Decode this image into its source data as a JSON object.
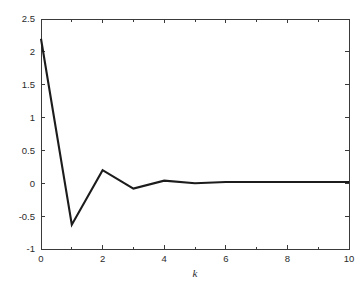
{
  "chart_data": {
    "type": "line",
    "title": "",
    "subtitle": "",
    "xlabel": "k",
    "ylabel": "",
    "xlim": [
      0,
      10
    ],
    "ylim": [
      -1,
      2.5
    ],
    "grid": false,
    "legend": null,
    "x": [
      0,
      1,
      2,
      3,
      4,
      5,
      6,
      7,
      8,
      9,
      10
    ],
    "values": [
      2.2,
      -0.63,
      0.2,
      -0.08,
      0.04,
      0.0,
      0.02,
      0.02,
      0.02,
      0.02,
      0.02
    ],
    "series": [
      {
        "name": "impulse response",
        "color": "#1c1c1c",
        "values": [
          2.2,
          -0.63,
          0.2,
          -0.08,
          0.04,
          0.0,
          0.02,
          0.02,
          0.02,
          0.02,
          0.02
        ]
      }
    ],
    "x_ticks": [
      0,
      2,
      4,
      6,
      8,
      10
    ],
    "x_tick_labels": [
      "0",
      "2",
      "4",
      "6",
      "8",
      "10"
    ],
    "x_minor_ticks": [
      1,
      3,
      5,
      7,
      9
    ],
    "y_ticks": [
      -1,
      -0.5,
      0,
      0.5,
      1,
      1.5,
      2,
      2.5
    ],
    "y_tick_labels": [
      "-1",
      "-0.5",
      "0",
      "0.5",
      "1",
      "1.5",
      "2",
      "2.5"
    ],
    "annotations": []
  },
  "figure": {
    "background_color": "#ffffff",
    "axes_color": "#3a3a3a",
    "line_color": "#1c1c1c"
  }
}
